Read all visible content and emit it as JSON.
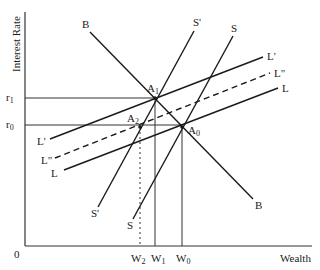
{
  "diagram": {
    "y_axis_label": "Interest Rate",
    "x_axis_label": "Wealth",
    "origin_label": "0",
    "y_ticks": [
      {
        "base": "r",
        "sub": "1"
      },
      {
        "base": "r",
        "sub": "0"
      }
    ],
    "x_ticks": [
      {
        "base": "W",
        "sub": "2"
      },
      {
        "base": "W",
        "sub": "1"
      },
      {
        "base": "W",
        "sub": "0"
      }
    ],
    "points": [
      {
        "base": "A",
        "sub": "1"
      },
      {
        "base": "A",
        "sub": "2"
      },
      {
        "base": "A",
        "sub": "0"
      }
    ],
    "curves": {
      "B_top": "B",
      "B_bottom": "B",
      "S_prime_top": "S'",
      "S_prime_bottom": "S'",
      "S_top": "S",
      "S_bottom": "S",
      "L_prime_right": "L'",
      "L_prime_left": "L'",
      "L_dprime_right": "L\"",
      "L_dprime_left": "L\"",
      "L_right": "L",
      "L_left": "L"
    },
    "line_color": "#1a1a1a"
  }
}
